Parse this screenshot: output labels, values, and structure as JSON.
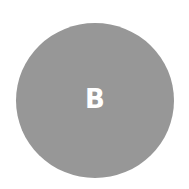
{
  "avatar": {
    "initial": "B",
    "background_color": "#979797",
    "text_color": "#ffffff"
  }
}
